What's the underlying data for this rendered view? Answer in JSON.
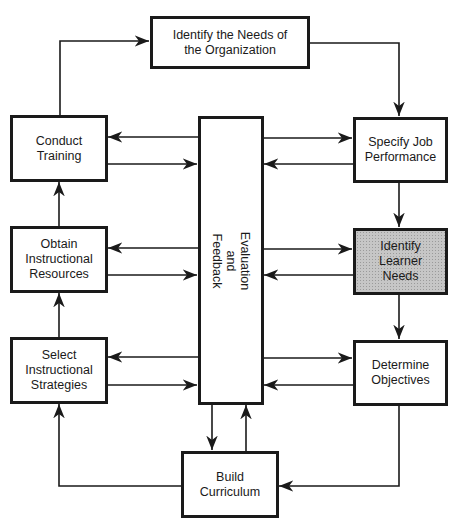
{
  "diagram": {
    "type": "instructional-design-cycle",
    "nodes": {
      "org_needs": {
        "label": "Identify the Needs of\nthe Organization"
      },
      "conduct_training": {
        "label": "Conduct\nTraining"
      },
      "obtain_resources": {
        "label": "Obtain\nInstructional\nResources"
      },
      "select_strategies": {
        "label": "Select\nInstructional\nStrategies"
      },
      "evaluation": {
        "label": "Evaluation\nand\nFeedback"
      },
      "specify_job": {
        "label": "Specify Job\nPerformance"
      },
      "learner_needs": {
        "label": "Identify\nLearner\nNeeds",
        "highlighted": true,
        "fill": "#c6c6c6"
      },
      "objectives": {
        "label": "Determine\nObjectives"
      },
      "curriculum": {
        "label": "Build\nCurriculum"
      }
    },
    "edges": [
      {
        "from": "conduct_training",
        "to": "org_needs"
      },
      {
        "from": "org_needs",
        "to": "specify_job"
      },
      {
        "from": "specify_job",
        "to": "learner_needs"
      },
      {
        "from": "learner_needs",
        "to": "objectives"
      },
      {
        "from": "objectives",
        "to": "curriculum"
      },
      {
        "from": "curriculum",
        "to": "select_strategies"
      },
      {
        "from": "select_strategies",
        "to": "obtain_resources"
      },
      {
        "from": "obtain_resources",
        "to": "conduct_training"
      },
      {
        "from": "evaluation",
        "to": "conduct_training",
        "bidirectional": true
      },
      {
        "from": "evaluation",
        "to": "obtain_resources",
        "bidirectional": true
      },
      {
        "from": "evaluation",
        "to": "select_strategies",
        "bidirectional": true
      },
      {
        "from": "evaluation",
        "to": "specify_job",
        "bidirectional": true
      },
      {
        "from": "evaluation",
        "to": "learner_needs",
        "bidirectional": true
      },
      {
        "from": "evaluation",
        "to": "objectives",
        "bidirectional": true
      },
      {
        "from": "evaluation",
        "to": "curriculum",
        "bidirectional": true
      }
    ],
    "colors": {
      "line": "#1a1a1a",
      "background": "#ffffff",
      "highlight": "#c6c6c6"
    }
  }
}
